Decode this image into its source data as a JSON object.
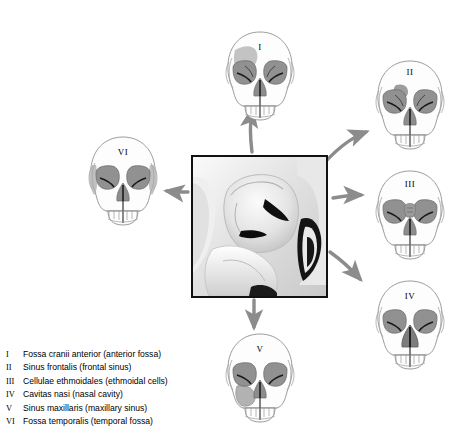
{
  "figure": {
    "type": "anatomical-diagram",
    "center_image_caption": "Grayscale close-up of orbital and sphenoid region"
  },
  "colors": {
    "arrow": "#8c8c8c",
    "outline": "#7a7a7a",
    "orbit_fill": "#8f8f8f",
    "highlight": "#b9b9b9",
    "highlight_dark": "#9a9a9a",
    "border": "#111111",
    "text": "#000000",
    "bone_light": "#fdfdfd",
    "bone_shadow": "#e6e6e6"
  },
  "skulls": [
    {
      "id": "I",
      "numeral": "I",
      "label": "Fossa cranii anterior",
      "highlight": "anterior-cranial-fossa"
    },
    {
      "id": "II",
      "numeral": "II",
      "label": "Sinus frontalis",
      "highlight": "frontal-sinus"
    },
    {
      "id": "III",
      "numeral": "III",
      "label": "Cellulae ethmoidales",
      "highlight": "ethmoidal-cells"
    },
    {
      "id": "IV",
      "numeral": "IV",
      "label": "Cavitas nasi",
      "highlight": "nasal-cavity"
    },
    {
      "id": "V",
      "numeral": "V",
      "label": "Sinus maxillaris",
      "highlight": "maxillary-sinus"
    },
    {
      "id": "VI",
      "numeral": "VI",
      "label": "Fossa temporalis",
      "highlight": "temporal-fossa"
    }
  ],
  "arrows": [
    {
      "name": "arrow-to-I",
      "from": "center",
      "to": "I",
      "direction": "up"
    },
    {
      "name": "arrow-to-II",
      "from": "center",
      "to": "II",
      "direction": "up-right"
    },
    {
      "name": "arrow-to-III",
      "from": "center",
      "to": "III",
      "direction": "right"
    },
    {
      "name": "arrow-to-IV",
      "from": "center",
      "to": "IV",
      "direction": "down-right"
    },
    {
      "name": "arrow-to-V",
      "from": "center",
      "to": "V",
      "direction": "down"
    },
    {
      "name": "arrow-to-VI",
      "from": "center",
      "to": "VI",
      "direction": "left"
    }
  ],
  "legend": {
    "items": [
      {
        "numeral": "I",
        "text": "Fossa cranii anterior (anterior fossa)"
      },
      {
        "numeral": "II",
        "text": "Sinus frontalis (frontal sinus)"
      },
      {
        "numeral": "III",
        "text": "Cellulae ethmoidales (ethmoidal cells)"
      },
      {
        "numeral": "IV",
        "text": "Cavitas nasi (nasal cavity)"
      },
      {
        "numeral": "V",
        "text": "Sinus maxillaris (maxillary sinus)"
      },
      {
        "numeral": "VI",
        "text": "Fossa temporalis (temporal fossa)"
      }
    ]
  }
}
